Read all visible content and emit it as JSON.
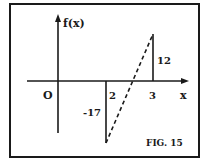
{
  "figure": {
    "caption": "FIG. 15",
    "y_axis_label": "f(x)",
    "x_axis_label": "x",
    "origin_label": "O",
    "x_ticks": [
      "2",
      "3"
    ],
    "values": [
      {
        "x": 2,
        "label": "-17",
        "fx": -17
      },
      {
        "x": 3,
        "label": "12",
        "fx": 12
      }
    ],
    "connector": "dashed line from (2, -17) to (3, 12)",
    "colors": {
      "ink": "#1a1a1a",
      "background": "#ffffff"
    }
  }
}
